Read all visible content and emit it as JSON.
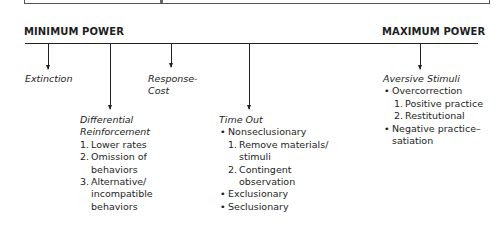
{
  "diagram": {
    "axis": {
      "min_label": "MINIMUM POWER",
      "max_label": "MAXIMUM POWER"
    },
    "nodes": [
      {
        "id": "extinction",
        "title": "Extinction"
      },
      {
        "id": "differential-reinforcement",
        "title_line1": "Differential",
        "title_line2": "Reinforcement",
        "items": [
          {
            "marker": "1.",
            "lines": [
              "Lower rates"
            ]
          },
          {
            "marker": "2.",
            "lines": [
              "Omission of",
              "behaviors"
            ]
          },
          {
            "marker": "3.",
            "lines": [
              "Alternative/",
              "incompatible",
              "behaviors"
            ]
          }
        ]
      },
      {
        "id": "response-cost",
        "title_line1": "Response-",
        "title_line2": "Cost"
      },
      {
        "id": "time-out",
        "title": "Time Out",
        "bullets": [
          {
            "label": "Nonseclusionary",
            "sub": [
              {
                "marker": "1.",
                "lines": [
                  "Remove materials/",
                  "stimuli"
                ]
              },
              {
                "marker": "2.",
                "lines": [
                  "Contingent",
                  "observation"
                ]
              }
            ]
          },
          {
            "label": "Exclusionary"
          },
          {
            "label": "Seclusionary"
          }
        ]
      },
      {
        "id": "aversive-stimuli",
        "title": "Aversive Stimuli",
        "bullets": [
          {
            "label": "Overcorrection",
            "sub": [
              {
                "marker": "1.",
                "lines": [
                  "Positive practice"
                ]
              },
              {
                "marker": "2.",
                "lines": [
                  "Restitutional"
                ]
              }
            ]
          },
          {
            "label_lines": [
              "Negative practice–",
              "satiation"
            ]
          }
        ]
      }
    ],
    "bullet_glyph": "•"
  }
}
